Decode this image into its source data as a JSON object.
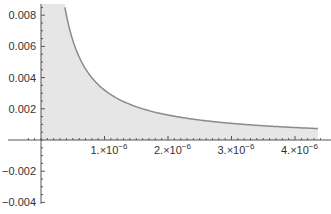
{
  "chart_data": {
    "type": "area",
    "title": "",
    "xlabel": "",
    "ylabel": "",
    "function": "y = a/x, a ≈ 3.2e-9, filled to axis",
    "x": [
      3.8e-07,
      5e-07,
      7.5e-07,
      1e-06,
      1.5e-06,
      2e-06,
      2.5e-06,
      3e-06,
      3.5e-06,
      4e-06,
      4.4e-06
    ],
    "series": [
      {
        "name": "curve",
        "values": [
          0.0085,
          0.0064,
          0.0043,
          0.0032,
          0.00213,
          0.0016,
          0.00128,
          0.00107,
          0.00091,
          0.0008,
          0.00073
        ]
      }
    ],
    "x_ticks": [
      {
        "value": 1e-06,
        "label_base": "1.×10",
        "label_exp": "−6"
      },
      {
        "value": 2e-06,
        "label_base": "2.×10",
        "label_exp": "−6"
      },
      {
        "value": 3e-06,
        "label_base": "3.×10",
        "label_exp": "−6"
      },
      {
        "value": 4e-06,
        "label_base": "4.×10",
        "label_exp": "−6"
      }
    ],
    "y_ticks": [
      {
        "value": 0.008,
        "label": "0.008"
      },
      {
        "value": 0.006,
        "label": "0.006"
      },
      {
        "value": 0.004,
        "label": "0.004"
      },
      {
        "value": 0.002,
        "label": "0.002"
      },
      {
        "value": -0.002,
        "label": "−0.002"
      },
      {
        "value": -0.004,
        "label": "−0.004"
      }
    ],
    "xlim": [
      -2e-07,
      4.4e-06
    ],
    "ylim": [
      -0.0042,
      0.0085
    ],
    "grid": false,
    "legend": "none",
    "colors": {
      "curve": "#8a8a8a",
      "fill": "#e6e6e6",
      "axis": "#555555"
    }
  }
}
